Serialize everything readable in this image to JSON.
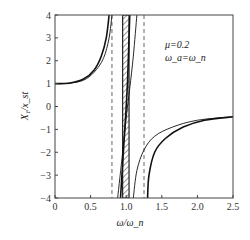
{
  "chart_data": {
    "type": "line",
    "title": "",
    "xlabel": "ω/ω_n",
    "ylabel": "X₁/x_st",
    "xlim": [
      0,
      2.5
    ],
    "ylim": [
      -4,
      4
    ],
    "xticks": [
      "0",
      "0.5",
      "1.0",
      "1.5",
      "2.0",
      "2.5"
    ],
    "yticks": [
      "4",
      "3",
      "2",
      "1",
      "0",
      "-1",
      "-2",
      "-3",
      "-4"
    ],
    "grid": false,
    "annotations": [
      "μ=0.2",
      "ω_a=ω_n"
    ],
    "dashed_lines_x": [
      0.8,
      1.25
    ],
    "hatched_band_x": [
      0.95,
      1.04
    ],
    "series": [
      {
        "name": "thick-curve",
        "style": "solid-thick",
        "branches": [
          {
            "x": [
              0,
              0.2,
              0.4,
              0.55,
              0.65,
              0.72,
              0.76
            ],
            "y": [
              1.0,
              1.02,
              1.2,
              1.6,
              2.2,
              3.0,
              4.0
            ]
          },
          {
            "x": [
              0.92,
              0.95,
              0.98,
              1.0,
              1.02,
              1.05
            ],
            "y": [
              -4.0,
              -2.5,
              -1.0,
              0,
              1.2,
              4.0
            ]
          },
          {
            "x": [
              1.3,
              1.32,
              1.4,
              1.55,
              1.8,
              2.1,
              2.5
            ],
            "y": [
              -4.0,
              -3.0,
              -2.0,
              -1.4,
              -0.9,
              -0.6,
              -0.45
            ]
          }
        ]
      },
      {
        "name": "thin-curve",
        "style": "solid-thin",
        "branches": [
          {
            "x": [
              0,
              0.2,
              0.4,
              0.55,
              0.68,
              0.76,
              0.8
            ],
            "y": [
              1.0,
              1.02,
              1.15,
              1.5,
              2.1,
              3.0,
              4.0
            ]
          },
          {
            "x": [
              0.88,
              0.95,
              1.0,
              1.05,
              1.1,
              1.15
            ],
            "y": [
              -4.0,
              -2.0,
              -0.5,
              0.8,
              2.2,
              4.0
            ]
          },
          {
            "x": [
              1.1,
              1.15,
              1.25,
              1.4,
              1.65,
              2.0,
              2.5
            ],
            "y": [
              -4.0,
              -2.8,
              -1.9,
              -1.3,
              -0.9,
              -0.6,
              -0.45
            ]
          }
        ]
      }
    ]
  }
}
